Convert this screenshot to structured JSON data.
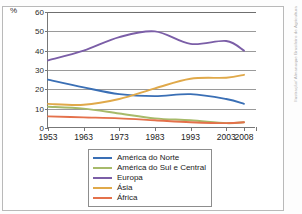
{
  "figure": {
    "top_caption": "",
    "credit": "Ilustração/ Almanaque Brasileiro de Agricultura"
  },
  "chart_data": {
    "type": "line",
    "title": "",
    "subtitle": "",
    "xlabel": "",
    "ylabel": "%",
    "y_unit_symbol": "%",
    "x": [
      "1953",
      "1963",
      "1973",
      "1983",
      "1993",
      "2003",
      "2008"
    ],
    "categories": [
      "1953",
      "1963",
      "1973",
      "1983",
      "1993",
      "2003",
      "2008"
    ],
    "xticklabels": [
      "1953",
      "1963",
      "1973",
      "1983",
      "1993",
      "2003",
      "2008"
    ],
    "yticklabels": [
      "0",
      "10",
      "20",
      "30",
      "40",
      "50",
      "60"
    ],
    "ylim": [
      0,
      60
    ],
    "ytick_step": 10,
    "grid": "horizontal",
    "legend_position": "below-center",
    "series": [
      {
        "name": "América do Norte",
        "color": "#3a6fb5",
        "values": [
          25,
          21,
          17.5,
          16.5,
          17.5,
          15,
          12.5
        ]
      },
      {
        "name": "América do Sul e Central",
        "color": "#a7ba6a",
        "values": [
          11,
          10,
          7.5,
          5,
          4,
          2.5,
          3
        ]
      },
      {
        "name": "Europa",
        "color": "#7b5ea7",
        "values": [
          35,
          40,
          47,
          50,
          43.5,
          45,
          40
        ]
      },
      {
        "name": "Ásia",
        "color": "#e0a94a",
        "values": [
          12.5,
          12,
          15,
          20.5,
          25.5,
          26,
          27.5
        ]
      },
      {
        "name": "África",
        "color": "#e4714b",
        "values": [
          6,
          5.5,
          5,
          4,
          3,
          2.5,
          3
        ]
      }
    ]
  }
}
